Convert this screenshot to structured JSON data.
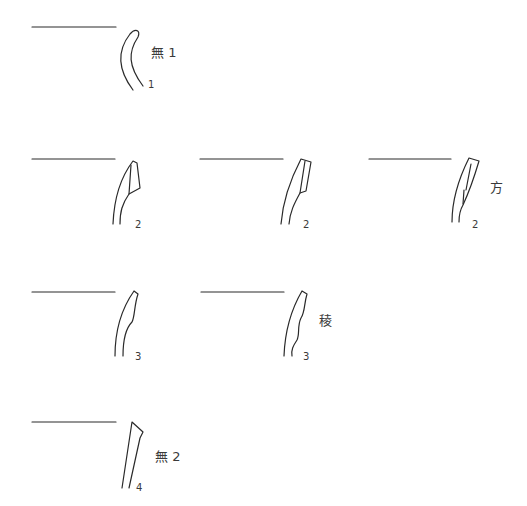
{
  "figure": {
    "type": "pottery rim profile drawings",
    "stroke_color": "#2a2a2a"
  },
  "profiles": [
    {
      "id": "p1",
      "number": "1",
      "category_label": "無 1"
    },
    {
      "id": "p2a",
      "number": "2",
      "category_label": ""
    },
    {
      "id": "p2b",
      "number": "2",
      "category_label": ""
    },
    {
      "id": "p2c",
      "number": "2",
      "category_label": "方"
    },
    {
      "id": "p3a",
      "number": "3",
      "category_label": ""
    },
    {
      "id": "p3b",
      "number": "3",
      "category_label": "稜"
    },
    {
      "id": "p4",
      "number": "4",
      "category_label": "無 2"
    }
  ]
}
